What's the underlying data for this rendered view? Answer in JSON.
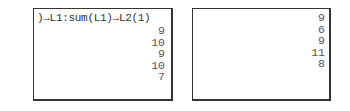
{
  "left_screen": {
    "command": ")→L1:sum(L1)→L2(1)",
    "results": [
      "9",
      "10",
      "9",
      "10",
      "7"
    ]
  },
  "right_screen": {
    "results": [
      "9",
      "6",
      "9",
      "11",
      "8"
    ]
  }
}
